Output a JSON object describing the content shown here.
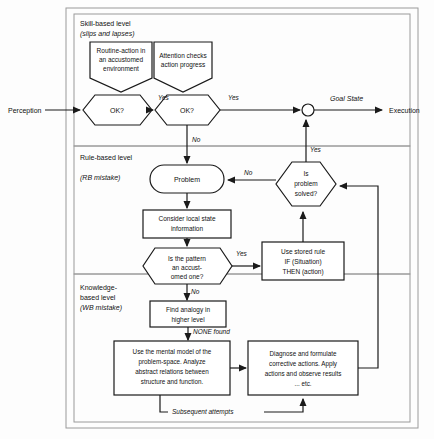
{
  "diagram": {
    "io": {
      "perception": "Perception",
      "execution": "Execution",
      "goal_state": "Goal State"
    },
    "levels": [
      {
        "name": "Skill-based level",
        "sub": "(slips and lapses)"
      },
      {
        "name": "Rule-based level",
        "sub": "(RB mistake)"
      },
      {
        "name": "Knowledge-",
        "name2": "based level",
        "sub": "(WB mistake)"
      }
    ],
    "nodes": {
      "routine_action": [
        "Routine-action in",
        "an accustomed",
        "environment"
      ],
      "attention_checks": [
        "Attention checks",
        "action progress"
      ],
      "ok1": "OK?",
      "ok2": "OK?",
      "problem": "Problem",
      "consider_local": [
        "Consider local state",
        "information"
      ],
      "pattern_check": [
        "Is the pattern",
        "an accust-",
        "omed one?"
      ],
      "stored_rule": [
        "Use stored rule",
        "IF (Situation)",
        "THEN (action)"
      ],
      "is_solved": [
        "Is",
        "problem",
        "solved?"
      ],
      "find_analogy": [
        "Find analogy in",
        "higher level"
      ],
      "mental_model": [
        "Use the mental model of the",
        "problem-space. Analyze",
        "abstract relations between",
        "structure and function."
      ],
      "diagnose": [
        "Diagnose  and  formulate",
        "corrective actions. Apply",
        "actions and observe results",
        "... etc."
      ]
    },
    "edge_labels": {
      "yes1": "Yes",
      "yes2": "Yes",
      "no_ok2": "No",
      "yes_pattern": "Yes",
      "no_pattern": "No",
      "yes_solved": "Yes",
      "no_solved": "No",
      "none_found": "NONE found",
      "subsequent": "Subsequent attempts"
    },
    "colors": {
      "stroke": "#1a1a1a",
      "panel_border": "#9a9a9a",
      "text": "#111111",
      "background": "#fdfdfd"
    }
  }
}
